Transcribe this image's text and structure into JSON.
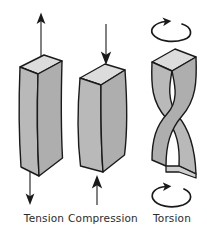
{
  "figure": {
    "title": "",
    "background_color": "#ffffff",
    "width": 207,
    "height": 233
  },
  "colors": {
    "outline": "#1a1a1a",
    "front_face": "#b9b9b9",
    "side_face": "#a8a8a8",
    "top_face": "#dcdcdc",
    "bottom_face": "#cfcfcf",
    "arrow": "#1a1a1a",
    "label": "#2b2b2b",
    "page_background": "#ffffff"
  },
  "panels": [
    {
      "id": "tension",
      "label": "Tension",
      "deformation": "necking",
      "description": "Rectangular prism pulled apart, narrowing at the waist",
      "arrows": [
        {
          "name": "tension-arrow-up",
          "direction": "up",
          "position": "top",
          "style": "straight"
        },
        {
          "name": "tension-arrow-down",
          "direction": "down",
          "position": "bottom",
          "style": "straight"
        }
      ]
    },
    {
      "id": "compression",
      "label": "Compression",
      "deformation": "bulging",
      "description": "Rectangular prism squashed, bulging outward at the waist",
      "arrows": [
        {
          "name": "compression-arrow-down",
          "direction": "down",
          "position": "top",
          "style": "straight"
        },
        {
          "name": "compression-arrow-up",
          "direction": "up",
          "position": "bottom",
          "style": "straight"
        }
      ]
    },
    {
      "id": "torsion",
      "label": "Torsion",
      "deformation": "twisting",
      "description": "Rectangular prism twisted about its long axis, faces crossing at mid height",
      "arrows": [
        {
          "name": "torsion-arrow-top",
          "direction": "clockwise",
          "position": "top",
          "style": "curved-loop"
        },
        {
          "name": "torsion-arrow-bottom",
          "direction": "clockwise",
          "position": "bottom",
          "style": "curved-loop"
        }
      ]
    }
  ],
  "captions": {
    "tension": {
      "text": "Tension",
      "x": 44,
      "y": 222
    },
    "compression": {
      "text": "Compression",
      "x": 103,
      "y": 222
    },
    "torsion": {
      "text": "Torsion",
      "x": 172,
      "y": 222
    }
  }
}
